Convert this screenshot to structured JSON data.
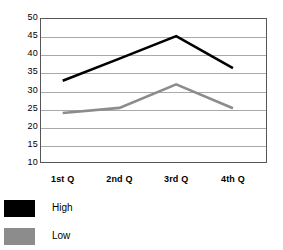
{
  "chart_data": {
    "type": "line",
    "title": "",
    "xlabel": "",
    "ylabel": "",
    "categories": [
      "1st Q",
      "2nd Q",
      "3rd Q",
      "4th Q"
    ],
    "series": [
      {
        "name": "High",
        "color": "#000000",
        "values": [
          32.7,
          38.8,
          45.0,
          36.2
        ]
      },
      {
        "name": "Low",
        "color": "#8c8c8c",
        "values": [
          23.8,
          25.2,
          31.7,
          25.1
        ]
      }
    ],
    "ylim": [
      10,
      50
    ],
    "yticks": [
      50,
      45,
      40,
      35,
      30,
      25,
      20,
      15,
      10
    ],
    "ytick_labels": [
      "50",
      "45",
      "40",
      "35",
      "30",
      "25",
      "20",
      "15",
      "10"
    ],
    "grid": true,
    "grid_color": "#a8a9ad",
    "axis_color": "#55565a",
    "legend_position": "bottom-left",
    "legend": [
      {
        "label": "High",
        "color": "#000000"
      },
      {
        "label": "Low",
        "color": "#8c8c8c"
      }
    ]
  }
}
